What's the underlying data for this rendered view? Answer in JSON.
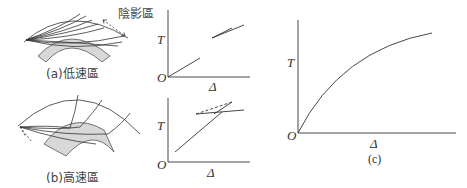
{
  "figure": {
    "panel_a": {
      "caption": "(a)低速區",
      "shadow_zone_label": "陰影區",
      "graph": {
        "y_label": "T",
        "x_label": "Δ",
        "origin_label": "O"
      }
    },
    "panel_b": {
      "caption": "(b)高速區",
      "graph": {
        "y_label": "T",
        "x_label": "Δ",
        "origin_label": "O"
      }
    },
    "panel_c": {
      "caption": "(c)",
      "graph": {
        "y_label": "T",
        "x_label": "Δ",
        "origin_label": "O"
      }
    },
    "colors": {
      "line": "#333333",
      "zone_fill": "#d8d8d8",
      "zone_stroke": "#555555"
    }
  }
}
